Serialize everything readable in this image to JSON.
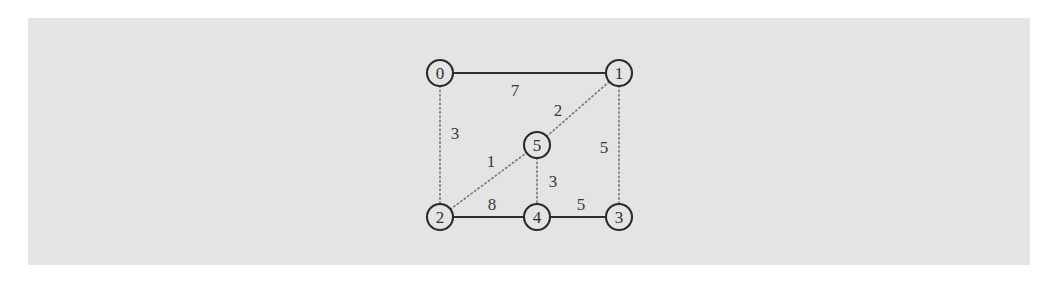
{
  "figure": {
    "background_color": "#ffffff",
    "panel_color": "#e4e4e4",
    "panel": {
      "x": 28,
      "y": 18,
      "width": 1002,
      "height": 247
    }
  },
  "chart_data": {
    "type": "diagram",
    "diagram_kind": "weighted-undirected-graph",
    "title": "",
    "xlabel": "",
    "ylabel": "",
    "node_radius": 13,
    "nodes": [
      {
        "id": "0",
        "label": "0",
        "x": 440,
        "y": 73
      },
      {
        "id": "1",
        "label": "1",
        "x": 619,
        "y": 73
      },
      {
        "id": "2",
        "label": "2",
        "x": 440,
        "y": 217
      },
      {
        "id": "3",
        "label": "3",
        "x": 619,
        "y": 217
      },
      {
        "id": "4",
        "label": "4",
        "x": 537,
        "y": 217
      },
      {
        "id": "5",
        "label": "5",
        "x": 537,
        "y": 145
      }
    ],
    "edges": [
      {
        "source": "0",
        "target": "1",
        "weight": 7,
        "style": "solid",
        "label_x": 515,
        "label_y": 90
      },
      {
        "source": "0",
        "target": "2",
        "weight": 3,
        "style": "dotted",
        "label_x": 455,
        "label_y": 133
      },
      {
        "source": "2",
        "target": "5",
        "weight": 1,
        "style": "dotted",
        "label_x": 491,
        "label_y": 161
      },
      {
        "source": "5",
        "target": "1",
        "weight": 2,
        "style": "dotted",
        "label_x": 558,
        "label_y": 110
      },
      {
        "source": "1",
        "target": "3",
        "weight": 5,
        "style": "dotted",
        "label_x": 604,
        "label_y": 147
      },
      {
        "source": "5",
        "target": "4",
        "weight": 3,
        "style": "dotted",
        "label_x": 553,
        "label_y": 181
      },
      {
        "source": "2",
        "target": "4",
        "weight": 8,
        "style": "solid",
        "label_x": 492,
        "label_y": 204
      },
      {
        "source": "4",
        "target": "3",
        "weight": 5,
        "style": "solid",
        "label_x": 581,
        "label_y": 204
      }
    ],
    "colors": {
      "solid_edge": "#2e2e2e",
      "dotted_edge": "#7b7b7b",
      "node_stroke": "#2b2b2b",
      "node_fill": "#e4e4e4",
      "text": "#303030",
      "panel": "#e4e4e4"
    }
  }
}
